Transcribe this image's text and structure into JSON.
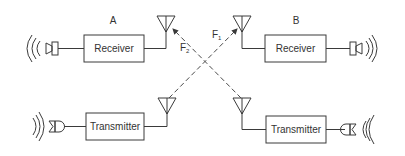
{
  "stations": [
    {
      "label": "A",
      "receiver_label": "Receiver",
      "transmitter_label": "Transmitter"
    },
    {
      "label": "B",
      "receiver_label": "Receiver",
      "transmitter_label": "Transmitter"
    }
  ],
  "links": [
    {
      "label": "F",
      "subscript": "1",
      "direction": "A transmitter to B receiver"
    },
    {
      "label": "F",
      "subscript": "2",
      "direction": "B transmitter to A receiver"
    }
  ],
  "icons": {
    "speaker": "speaker-icon",
    "microphone": "microphone-icon",
    "antenna": "antenna-icon",
    "sound_waves": "sound-waves-icon"
  },
  "colors": {
    "line": "#3a3a3a",
    "text": "#333333",
    "background": "#ffffff"
  }
}
